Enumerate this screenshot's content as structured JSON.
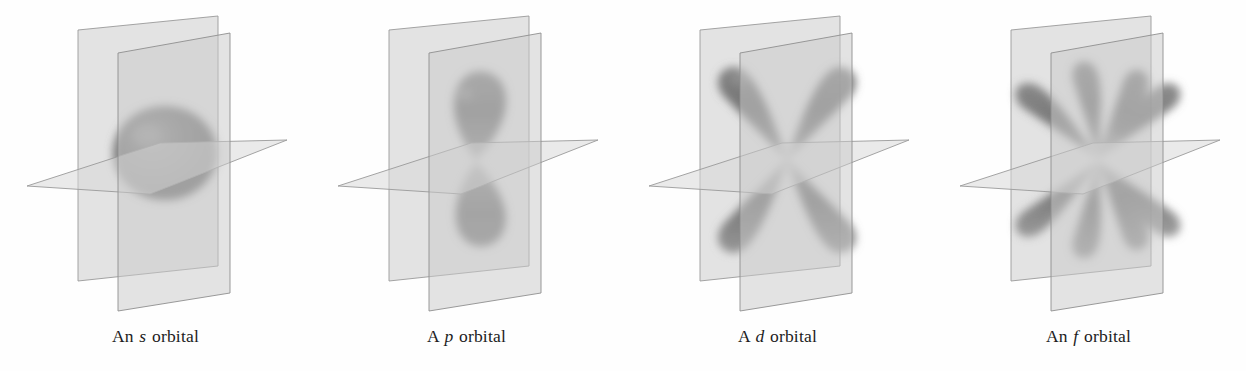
{
  "figure": {
    "background_color": "#ffffff",
    "panel_count": 4
  },
  "style": {
    "plane_fill": "#cfcfcf",
    "plane_edge": "#8a8a8a",
    "orbital_fill": "#6e6e6e",
    "orbital_core": "#5a5a5a",
    "caption_color": "#1c1c1c"
  },
  "panels": [
    {
      "id": "s-orbital",
      "orbital_letter": "s",
      "caption_prefix": "An",
      "caption_suffix": "orbital",
      "shape": "sphere",
      "lobe_count": 1,
      "nodal_planes": 0,
      "planes": [
        "back-vertical-plane",
        "front-vertical-plane",
        "horizontal-plane"
      ]
    },
    {
      "id": "p-orbital",
      "orbital_letter": "p",
      "caption_prefix": "A",
      "caption_suffix": "orbital",
      "shape": "dumbbell",
      "lobe_count": 2,
      "nodal_planes": 1,
      "planes": [
        "back-vertical-plane",
        "front-vertical-plane",
        "horizontal-plane"
      ]
    },
    {
      "id": "d-orbital",
      "orbital_letter": "d",
      "caption_prefix": "A",
      "caption_suffix": "orbital",
      "shape": "cloverleaf",
      "lobe_count": 4,
      "nodal_planes": 2,
      "planes": [
        "back-vertical-plane",
        "front-vertical-plane",
        "horizontal-plane"
      ]
    },
    {
      "id": "f-orbital",
      "orbital_letter": "f",
      "caption_prefix": "An",
      "caption_suffix": "orbital",
      "shape": "rosette",
      "lobe_count": 8,
      "nodal_planes": 3,
      "planes": [
        "back-vertical-plane",
        "front-vertical-plane",
        "horizontal-plane"
      ]
    }
  ]
}
